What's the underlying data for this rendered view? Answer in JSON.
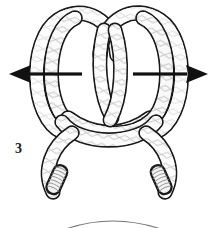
{
  "figure": {
    "kind": "knot-tying-instruction-diagram",
    "step_label": "3",
    "background_color": "#ffffff",
    "width": 216,
    "height": 228
  },
  "colors": {
    "rope_outline": "#1a1a1a",
    "rope_fill": "#ffffff",
    "rope_shade": "#e4e4e4",
    "rope_weave": "#9a9a9a",
    "rope_weave_light": "#c4c4c4",
    "arrow": "#111111",
    "ghost_arc": "#6f6f6f",
    "end_band": "#8c8c8c"
  },
  "arrows": [
    {
      "name": "pull-left-arrow",
      "direction": "left",
      "tip_x": 9,
      "tail_x": 82,
      "y": 74,
      "shaft_thickness": 3.2,
      "head_length": 22,
      "head_half_width": 9
    },
    {
      "name": "pull-right-arrow",
      "direction": "right",
      "tip_x": 208,
      "tail_x": 133,
      "y": 74,
      "shaft_thickness": 3.2,
      "head_length": 22,
      "head_half_width": 9
    }
  ],
  "rope": {
    "thickness": 13,
    "outline_width": 2.4,
    "description": "braided cord forming two overlapping loops above a crossing, with two cut ends hanging below",
    "loops": [
      {
        "name": "left-loop",
        "center_x": 77,
        "center_y": 73,
        "radius_x": 37,
        "radius_y": 55
      },
      {
        "name": "right-loop",
        "center_x": 140,
        "center_y": 73,
        "radius_x": 37,
        "radius_y": 55
      }
    ],
    "ends": [
      {
        "name": "left-rope-end",
        "x": 57,
        "y": 193,
        "angle": 28,
        "bands": 9
      },
      {
        "name": "right-rope-end",
        "x": 161,
        "y": 193,
        "angle": -28,
        "bands": 9
      }
    ]
  },
  "ghost_arc": {
    "name": "background-arc",
    "start_x": 66,
    "start_y": 228,
    "control_x": 112,
    "control_y": 214,
    "end_x": 160,
    "end_y": 228,
    "stroke_width": 1.1
  }
}
